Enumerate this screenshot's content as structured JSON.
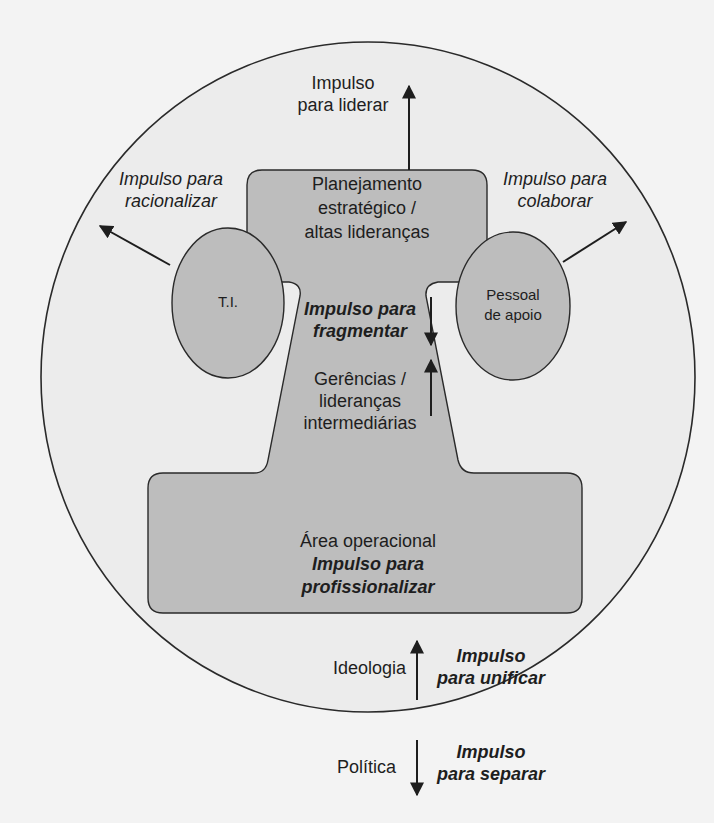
{
  "diagram": {
    "colors": {
      "background": "#f3f3f3",
      "outer_circle_fill": "#ececec",
      "shape_fill": "#bdbdbd",
      "stroke": "#2a2a2a",
      "text": "#1e1e1e"
    },
    "top_box": {
      "label_lines": [
        "Planejamento",
        "estratégico /",
        "altas lideranças"
      ],
      "force": {
        "lines": [
          "Impulso",
          "para liderar"
        ],
        "direction": "up"
      }
    },
    "left_ellipse": {
      "label": "T.I.",
      "force": {
        "lines": [
          "Impulso para",
          "racionalizar"
        ],
        "direction": "up-left"
      }
    },
    "right_ellipse": {
      "label_lines": [
        "Pessoal",
        "de apoio"
      ],
      "force": {
        "lines": [
          "Impulso para",
          "colaborar"
        ],
        "direction": "up-right"
      }
    },
    "middle_line": {
      "force": {
        "lines": [
          "Impulso para",
          "fragmentar"
        ],
        "direction": "down-up-opposed"
      },
      "label_lines": [
        "Gerências /",
        "lideranças",
        "intermediárias"
      ]
    },
    "bottom_box": {
      "label": "Área operacional",
      "force": {
        "lines": [
          "Impulso para",
          "profissionalizar"
        ]
      }
    },
    "ideology": {
      "label": "Ideologia",
      "force": {
        "lines": [
          "Impulso",
          "para unificar"
        ],
        "direction": "up"
      }
    },
    "politics": {
      "label": "Política",
      "force": {
        "lines": [
          "Impulso",
          "para separar"
        ],
        "direction": "down"
      }
    }
  }
}
